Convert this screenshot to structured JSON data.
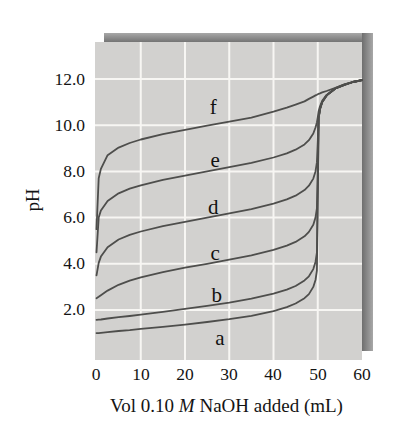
{
  "colors": {
    "page_bg": "#ffffff",
    "plot_bg": "#d2d1cf",
    "grid": "#f7f6f3",
    "curve": "#4e4e4c",
    "shadow_dark": "#6e6e6e",
    "shadow_light": "#a8a8a8",
    "text": "#141414"
  },
  "chart_data": {
    "type": "line",
    "title": "",
    "xlabel": "Vol 0.10 M NaOH added (mL)",
    "xlabel_parts": {
      "prefix": "Vol 0.10 ",
      "italic": "M",
      "suffix": " NaOH added (mL)"
    },
    "ylabel": "pH",
    "xlim": [
      0,
      60
    ],
    "ylim": [
      0,
      13.7
    ],
    "x_ticks": [
      0,
      10,
      20,
      30,
      40,
      50,
      60
    ],
    "y_ticks": [
      2,
      4,
      6,
      8,
      10,
      12
    ],
    "x_tick_labels": [
      "0",
      "10",
      "20",
      "30",
      "40",
      "50",
      "60"
    ],
    "y_tick_labels": [
      "12.0",
      "10.0",
      "8.0",
      "6.0",
      "4.0",
      "2.0"
    ],
    "grid": true,
    "legend": "none (curves labeled a-f directly on plot)",
    "x": [
      0,
      0.5,
      1,
      2.5,
      5,
      7.5,
      10,
      15,
      20,
      25,
      30,
      35,
      40,
      43,
      45,
      47,
      48,
      49,
      49.5,
      49.8,
      50,
      50.2,
      50.5,
      51,
      52,
      54,
      56,
      58,
      60
    ],
    "series": [
      {
        "name": "a",
        "label_position": {
          "ml": 27.9,
          "ph": 0.8
        },
        "values": [
          1.0,
          1.0,
          1.01,
          1.04,
          1.09,
          1.13,
          1.18,
          1.27,
          1.37,
          1.48,
          1.6,
          1.75,
          1.95,
          2.12,
          2.28,
          2.51,
          2.69,
          3.0,
          3.3,
          3.7,
          7.0,
          10.3,
          10.7,
          11.0,
          11.29,
          11.59,
          11.75,
          11.87,
          11.95
        ]
      },
      {
        "name": "b",
        "label_position": {
          "ml": 27.2,
          "ph": 2.65
        },
        "values": [
          1.57,
          1.58,
          1.59,
          1.63,
          1.69,
          1.74,
          1.8,
          1.92,
          2.05,
          2.18,
          2.32,
          2.49,
          2.71,
          2.88,
          3.04,
          3.28,
          3.46,
          3.77,
          4.08,
          4.48,
          7.3,
          10.3,
          10.7,
          11.0,
          11.29,
          11.59,
          11.75,
          11.87,
          11.95
        ]
      },
      {
        "name": "c",
        "label_position": {
          "ml": 26.8,
          "ph": 4.47
        },
        "values": [
          2.51,
          2.57,
          2.64,
          2.84,
          3.09,
          3.27,
          3.41,
          3.64,
          3.83,
          4.0,
          4.18,
          4.37,
          4.6,
          4.79,
          4.95,
          5.19,
          5.38,
          5.69,
          6.0,
          6.4,
          8.35,
          10.31,
          10.7,
          11.0,
          11.29,
          11.59,
          11.75,
          11.87,
          11.95
        ]
      },
      {
        "name": "d",
        "label_position": {
          "ml": 26.4,
          "ph": 6.46
        },
        "values": [
          3.5,
          4.04,
          4.31,
          4.72,
          5.05,
          5.25,
          5.4,
          5.63,
          5.82,
          6.0,
          6.18,
          6.37,
          6.6,
          6.79,
          6.95,
          7.19,
          7.38,
          7.69,
          8.0,
          8.39,
          9.35,
          10.33,
          10.71,
          11.01,
          11.29,
          11.59,
          11.75,
          11.87,
          11.95
        ]
      },
      {
        "name": "e",
        "label_position": {
          "ml": 26.8,
          "ph": 8.49
        },
        "values": [
          4.5,
          6.0,
          6.31,
          6.72,
          7.05,
          7.25,
          7.4,
          7.63,
          7.82,
          8.0,
          8.18,
          8.37,
          8.6,
          8.78,
          8.94,
          9.17,
          9.35,
          9.64,
          9.9,
          10.12,
          10.35,
          10.6,
          10.82,
          11.05,
          11.31,
          11.6,
          11.76,
          11.87,
          11.95
        ]
      },
      {
        "name": "f",
        "label_position": {
          "ml": 26.4,
          "ph": 10.79
        },
        "values": [
          5.5,
          7.7,
          8.11,
          8.7,
          9.03,
          9.23,
          9.38,
          9.61,
          9.8,
          9.98,
          10.15,
          10.33,
          10.59,
          10.76,
          10.89,
          11.03,
          11.14,
          11.24,
          11.29,
          11.32,
          11.34,
          11.36,
          11.38,
          11.42,
          11.48,
          11.62,
          11.77,
          11.88,
          11.95
        ]
      }
    ]
  }
}
